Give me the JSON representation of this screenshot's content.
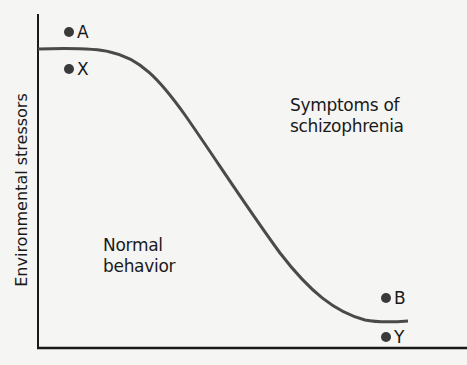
{
  "diagram": {
    "y_axis_label": "Environmental stressors",
    "x_axis_label": "",
    "regions": {
      "upper_right": [
        "Symptoms of",
        "schizophrenia"
      ],
      "lower_left": [
        "Normal",
        "behavior"
      ]
    },
    "points": [
      {
        "id": "A",
        "label": "A"
      },
      {
        "id": "X",
        "label": "X"
      },
      {
        "id": "B",
        "label": "B"
      },
      {
        "id": "Y",
        "label": "Y"
      }
    ],
    "colors": {
      "background": "#f5f5f4",
      "curve": "#4a4a4a",
      "axis": "#1a1a1a",
      "dot": "#3a3a3a"
    }
  }
}
